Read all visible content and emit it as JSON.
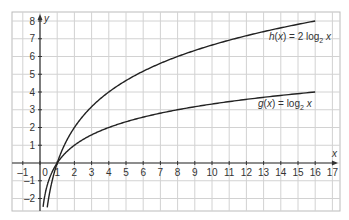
{
  "chart_data": {
    "type": "line",
    "title": "",
    "xlabel": "x",
    "ylabel": "y",
    "xlim": [
      -1,
      17
    ],
    "ylim": [
      -2.5,
      8.3
    ],
    "grid": true,
    "x_ticks": [
      -1,
      0,
      1,
      2,
      3,
      4,
      5,
      6,
      7,
      8,
      9,
      10,
      11,
      12,
      13,
      14,
      15,
      16,
      17
    ],
    "y_ticks": [
      -2,
      -1,
      1,
      2,
      3,
      4,
      5,
      6,
      7,
      8
    ],
    "series": [
      {
        "name": "h(x) = 2 log2 x",
        "label_prefix": "h(x) = 2 log",
        "label_sub": "2",
        "label_suffix": " x",
        "formula": "2*log2(x)",
        "x": [
          0.42,
          0.5,
          1,
          2,
          3,
          4,
          5,
          6,
          7,
          8,
          9,
          10,
          11,
          12,
          13,
          14,
          15,
          16
        ],
        "values": [
          -2.5,
          -2,
          0,
          2,
          3.17,
          4,
          4.64,
          5.17,
          5.61,
          6,
          6.34,
          6.64,
          6.92,
          7.17,
          7.4,
          7.61,
          7.81,
          8
        ]
      },
      {
        "name": "g(x) = log2 x",
        "label_prefix": "g(x) = log",
        "label_sub": "2",
        "label_suffix": " x",
        "formula": "log2(x)",
        "x": [
          0.18,
          0.25,
          0.5,
          1,
          2,
          3,
          4,
          5,
          6,
          7,
          8,
          9,
          10,
          11,
          12,
          13,
          14,
          15,
          16
        ],
        "values": [
          -2.5,
          -2,
          -1,
          0,
          1,
          1.58,
          2,
          2.32,
          2.58,
          2.81,
          3,
          3.17,
          3.32,
          3.46,
          3.58,
          3.7,
          3.81,
          3.91,
          4
        ]
      }
    ],
    "annotations": [
      {
        "text": "h(x) = 2 log2 x",
        "near": [
          12.5,
          7.1
        ]
      },
      {
        "text": "g(x) = log2 x",
        "near": [
          12.5,
          3.1
        ]
      }
    ],
    "legend": "inline labels near curves"
  }
}
